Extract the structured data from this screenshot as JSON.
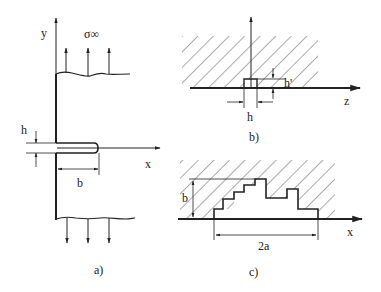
{
  "panels": {
    "a": {
      "caption": "a)",
      "labels": {
        "y_axis": "y",
        "x_axis": "x",
        "stress": "σ∞",
        "crack_height": "h",
        "crack_length": "b"
      }
    },
    "b": {
      "caption": "b)",
      "labels": {
        "z_axis": "z",
        "notch_width": "h",
        "notch_height": "h'"
      }
    },
    "c": {
      "caption": "c)",
      "labels": {
        "x_axis": "x",
        "depth": "b",
        "width": "2a"
      }
    }
  },
  "colors": {
    "ink": "#222222",
    "hatch": "#444444",
    "background": "#ffffff"
  }
}
